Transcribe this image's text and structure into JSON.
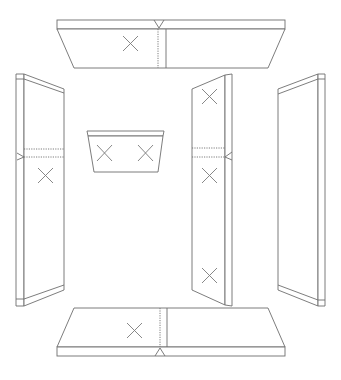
{
  "diagram": {
    "title": "",
    "stroke_color": "#6e6e6e",
    "background": "#ffffff",
    "panels": [
      {
        "id": "top-panel",
        "label": "",
        "markers": 1,
        "orientation": "horizontal"
      },
      {
        "id": "left-panel",
        "label": "",
        "markers": 1,
        "orientation": "vertical"
      },
      {
        "id": "center-small-panel",
        "label": "",
        "markers": 2,
        "orientation": "horizontal"
      },
      {
        "id": "center-right-panel",
        "label": "",
        "markers": 3,
        "orientation": "vertical"
      },
      {
        "id": "right-panel",
        "label": "",
        "markers": 0,
        "orientation": "vertical"
      },
      {
        "id": "bottom-panel",
        "label": "",
        "markers": 1,
        "orientation": "horizontal"
      }
    ]
  }
}
